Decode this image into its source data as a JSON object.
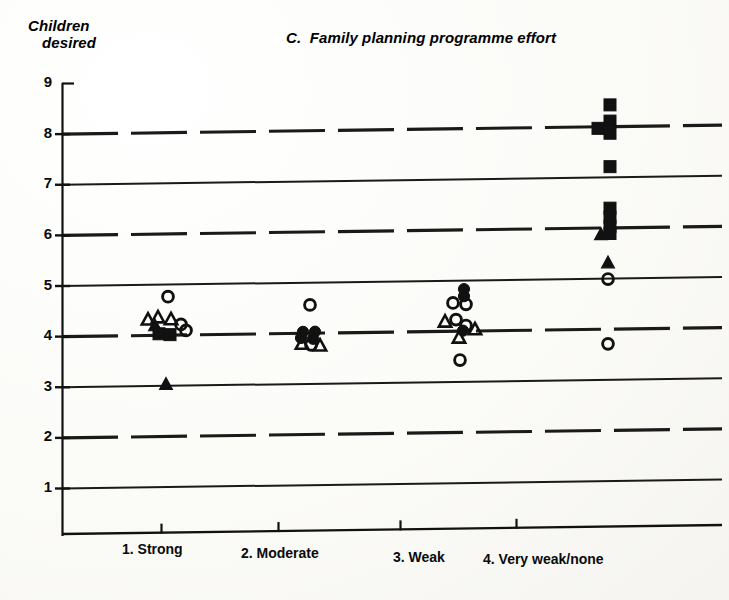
{
  "figure": {
    "panel_letter": "C.",
    "title": "C.  Family planning programme effort",
    "ylabel_line1": "Children",
    "ylabel_line2": "desired"
  },
  "axis": {
    "y_ticks": [
      "9",
      "8",
      "7",
      "6",
      "5",
      "4",
      "3",
      "2",
      "1"
    ],
    "x_ticks": [
      "1. Strong",
      "2. Moderate",
      "3. Weak",
      "4. Very weak/none"
    ]
  },
  "colors": {
    "ink": "#111111",
    "paper": "#fdfdfb",
    "gridline": "#1a1a1a"
  },
  "chart_data": {
    "type": "scatter",
    "title": "C.  Family planning programme effort",
    "xlabel": "",
    "ylabel": "Children desired",
    "ylim": [
      0.6,
      9
    ],
    "grid": true,
    "grid_style": "odd values solid, even values dashed",
    "legend": [],
    "categories": [
      "1. Strong",
      "2. Moderate",
      "3. Weak",
      "4. Very weak/none"
    ],
    "marker_types": [
      "open-circle",
      "open-triangle",
      "filled-triangle",
      "filled-circle",
      "filled-square"
    ],
    "series": [
      {
        "name": "1. Strong",
        "category_index": 1,
        "points": [
          {
            "dx": 0,
            "y": 4.75,
            "marker": "open-circle"
          },
          {
            "dx": -20,
            "y": 4.3,
            "marker": "open-triangle"
          },
          {
            "dx": -10,
            "y": 4.34,
            "marker": "open-triangle"
          },
          {
            "dx": 3,
            "y": 4.3,
            "marker": "open-triangle"
          },
          {
            "dx": -13,
            "y": 4.18,
            "marker": "filled-triangle"
          },
          {
            "dx": 13,
            "y": 4.2,
            "marker": "open-circle"
          },
          {
            "dx": 18,
            "y": 4.08,
            "marker": "open-circle"
          },
          {
            "dx": -9,
            "y": 4.02,
            "marker": "filled-square"
          },
          {
            "dx": 2,
            "y": 4.0,
            "marker": "filled-square"
          },
          {
            "dx": -2,
            "y": 3.02,
            "marker": "filled-triangle"
          }
        ]
      },
      {
        "name": "2. Moderate",
        "category_index": 2,
        "points": [
          {
            "dx": 0,
            "y": 4.55,
            "marker": "open-circle"
          },
          {
            "dx": -7,
            "y": 4.02,
            "marker": "filled-circle"
          },
          {
            "dx": 5,
            "y": 4.02,
            "marker": "filled-circle"
          },
          {
            "dx": -9,
            "y": 3.9,
            "marker": "filled-circle"
          },
          {
            "dx": 3,
            "y": 3.88,
            "marker": "filled-circle"
          },
          {
            "dx": -8,
            "y": 3.78,
            "marker": "open-triangle"
          },
          {
            "dx": 1,
            "y": 3.76,
            "marker": "open-circle"
          },
          {
            "dx": 10,
            "y": 3.74,
            "marker": "open-triangle"
          }
        ]
      },
      {
        "name": "3. Weak",
        "category_index": 3,
        "points": [
          {
            "dx": 2,
            "y": 4.82,
            "marker": "filled-circle"
          },
          {
            "dx": 2,
            "y": 4.68,
            "marker": "filled-circle"
          },
          {
            "dx": -9,
            "y": 4.55,
            "marker": "open-circle"
          },
          {
            "dx": 4,
            "y": 4.52,
            "marker": "open-circle"
          },
          {
            "dx": -6,
            "y": 4.22,
            "marker": "open-circle"
          },
          {
            "dx": -17,
            "y": 4.18,
            "marker": "open-triangle"
          },
          {
            "dx": 4,
            "y": 4.1,
            "marker": "open-circle"
          },
          {
            "dx": 1,
            "y": 4.0,
            "marker": "filled-circle"
          },
          {
            "dx": 13,
            "y": 4.02,
            "marker": "open-triangle"
          },
          {
            "dx": -3,
            "y": 3.86,
            "marker": "open-triangle"
          },
          {
            "dx": -2,
            "y": 3.42,
            "marker": "open-circle"
          }
        ]
      },
      {
        "name": "4. Very weak/none",
        "category_index": 4,
        "points": [
          {
            "dx": 2,
            "y": 8.42,
            "marker": "filled-square"
          },
          {
            "dx": 2,
            "y": 8.1,
            "marker": "filled-square"
          },
          {
            "dx": -10,
            "y": 7.96,
            "marker": "filled-square"
          },
          {
            "dx": 2,
            "y": 7.86,
            "marker": "filled-square"
          },
          {
            "dx": 2,
            "y": 7.2,
            "marker": "filled-square"
          },
          {
            "dx": 2,
            "y": 6.38,
            "marker": "filled-square"
          },
          {
            "dx": 2,
            "y": 6.2,
            "marker": "filled-square"
          },
          {
            "dx": 2,
            "y": 6.02,
            "marker": "filled-square"
          },
          {
            "dx": 2,
            "y": 5.88,
            "marker": "filled-square"
          },
          {
            "dx": -7,
            "y": 5.86,
            "marker": "filled-triangle"
          },
          {
            "dx": 0,
            "y": 5.3,
            "marker": "filled-triangle"
          },
          {
            "dx": 0,
            "y": 4.98,
            "marker": "open-circle"
          },
          {
            "dx": 0,
            "y": 3.7,
            "marker": "open-circle"
          }
        ]
      }
    ]
  }
}
